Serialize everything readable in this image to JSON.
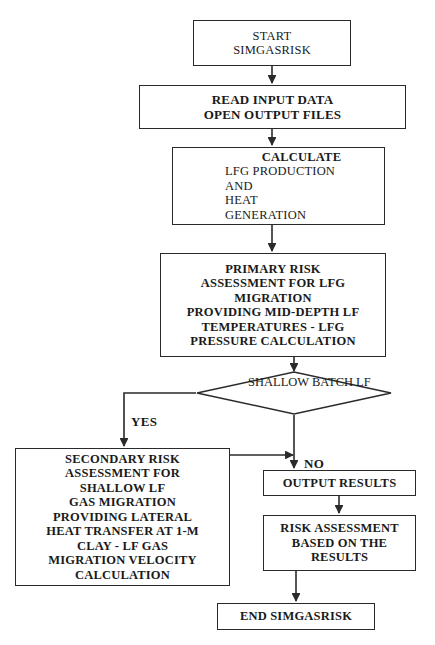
{
  "diagram": {
    "type": "flowchart",
    "colors": {
      "background": "#ffffff",
      "stroke": "#2a2a2a",
      "text": "#1a1a1a"
    },
    "nodes": {
      "start": {
        "shape": "rectangle",
        "lines": [
          "START",
          "SIMGASRISK"
        ]
      },
      "read": {
        "shape": "rectangle",
        "lines": [
          "READ INPUT DATA",
          "OPEN OUTPUT FILES"
        ]
      },
      "calculate": {
        "shape": "rectangle",
        "header": "CALCULATE",
        "lines": [
          "LFG PRODUCTION",
          "AND",
          "HEAT",
          "GENERATION"
        ]
      },
      "primary": {
        "shape": "rectangle",
        "lines": [
          "PRIMARY RISK",
          "ASSESSMENT FOR LFG",
          "MIGRATION",
          "PROVIDING MID-DEPTH LF",
          "TEMPERATURES - LFG",
          "PRESSURE CALCULATION"
        ]
      },
      "decision": {
        "shape": "diamond",
        "lines": [
          "SHALLOW",
          "BATCH LF"
        ]
      },
      "secondary": {
        "shape": "rectangle",
        "lines": [
          "SECONDARY RISK",
          "ASSESSMENT FOR",
          "SHALLOW LF",
          "GAS MIGRATION",
          "PROVIDING LATERAL",
          "HEAT TRANSFER AT 1-M",
          "CLAY - LF GAS",
          "MIGRATION VELOCITY",
          "CALCULATION"
        ]
      },
      "output": {
        "shape": "rectangle",
        "lines": [
          "OUTPUT RESULTS"
        ]
      },
      "riskassess": {
        "shape": "rectangle",
        "lines": [
          "RISK ASSESSMENT",
          "BASED ON THE",
          "RESULTS"
        ]
      },
      "end": {
        "shape": "rectangle",
        "lines": [
          "END SIMGASRISK"
        ]
      }
    },
    "edge_labels": {
      "yes": "YES",
      "no": "NO"
    }
  }
}
